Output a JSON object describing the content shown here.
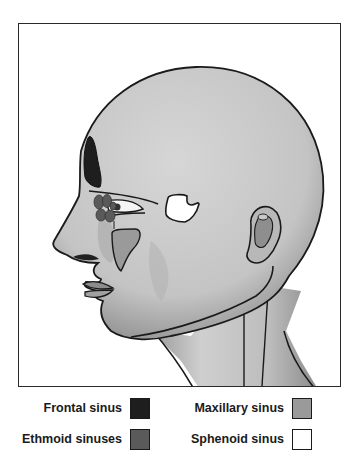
{
  "legend": {
    "items": [
      {
        "label": "Frontal sinus",
        "color": "#1e1e1e"
      },
      {
        "label": "Ethmoid sinuses",
        "color": "#5a5a5a"
      },
      {
        "label": "Maxillary sinus",
        "color": "#9a9a9a"
      },
      {
        "label": "Sphenoid sinus",
        "color": "#ffffff"
      }
    ]
  },
  "colors": {
    "skin": "#c9c9c9",
    "skin_shadow": "#a8a8a8",
    "outline": "#1a1a1a",
    "frame_border": "#2a2a2a"
  }
}
